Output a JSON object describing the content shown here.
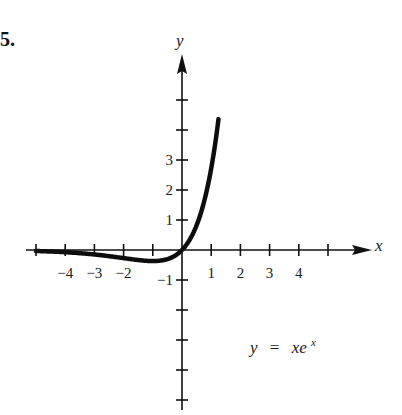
{
  "problem_number": "5.",
  "chart_data": {
    "type": "line",
    "title": "",
    "equation": "y = xe^x",
    "annotation": {
      "text_y": "y",
      "text_eq": "=",
      "text_x": "xe",
      "text_exp": "x"
    },
    "xlabel": "x",
    "ylabel": "y",
    "xlim": [
      -5,
      6
    ],
    "ylim": [
      -5,
      6
    ],
    "grid": false,
    "x_tick_positions": [
      -5,
      -4,
      -3,
      -2,
      -1,
      1,
      2,
      3,
      4,
      5
    ],
    "x_tick_labels": [
      {
        "value": -4,
        "label": "−4"
      },
      {
        "value": -3,
        "label": "−3"
      },
      {
        "value": -2,
        "label": "−2"
      },
      {
        "value": 1,
        "label": "1"
      },
      {
        "value": 2,
        "label": "2"
      },
      {
        "value": 3,
        "label": "3"
      },
      {
        "value": 4,
        "label": "4"
      }
    ],
    "y_tick_positions": [
      -5,
      -4,
      -3,
      -2,
      -1,
      1,
      2,
      3,
      4,
      5
    ],
    "y_tick_labels": [
      {
        "value": 3,
        "label": "3"
      },
      {
        "value": 2,
        "label": "2"
      },
      {
        "value": 1,
        "label": "1"
      },
      {
        "value": -1,
        "label": "−1"
      }
    ],
    "series": [
      {
        "name": "y = xe^x",
        "x": [
          -5,
          -4.5,
          -4,
          -3.5,
          -3,
          -2.5,
          -2,
          -1.5,
          -1,
          -0.75,
          -0.5,
          -0.25,
          0,
          0.25,
          0.5,
          0.75,
          1,
          1.1,
          1.2,
          1.25
        ],
        "y": [
          -0.034,
          -0.05,
          -0.073,
          -0.106,
          -0.149,
          -0.205,
          -0.271,
          -0.335,
          -0.368,
          -0.354,
          -0.303,
          -0.195,
          0,
          0.321,
          0.824,
          1.588,
          2.718,
          3.304,
          3.984,
          4.363
        ]
      }
    ]
  }
}
